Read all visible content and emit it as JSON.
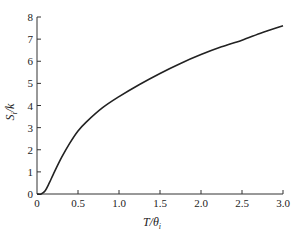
{
  "chart_data": {
    "type": "line",
    "title": "",
    "xlabel": "T/θ_i",
    "ylabel": "S_i/k",
    "xlim": [
      0,
      3.0
    ],
    "ylim": [
      0,
      8
    ],
    "grid": false,
    "legend": null,
    "x_ticks": [
      "0",
      "0.5",
      "1.0",
      "1.5",
      "2.0",
      "2.5",
      "3.0"
    ],
    "y_ticks": [
      "0",
      "1",
      "2",
      "3",
      "4",
      "5",
      "6",
      "7",
      "8"
    ],
    "series": [
      {
        "name": "S_i/k",
        "x": [
          0,
          0.05,
          0.1,
          0.15,
          0.2,
          0.3,
          0.4,
          0.5,
          0.6,
          0.8,
          1.0,
          1.25,
          1.5,
          1.75,
          2.0,
          2.25,
          2.5,
          2.75,
          3.0
        ],
        "y": [
          0,
          0.0,
          0.15,
          0.5,
          0.9,
          1.65,
          2.3,
          2.85,
          3.25,
          3.9,
          4.4,
          4.95,
          5.45,
          5.9,
          6.3,
          6.65,
          6.95,
          7.3,
          7.6
        ]
      }
    ]
  },
  "labels": {
    "xlabel_main": "T/θ",
    "xlabel_sub": "i",
    "ylabel_main": "S",
    "ylabel_sub": "i",
    "ylabel_tail": "/k"
  }
}
